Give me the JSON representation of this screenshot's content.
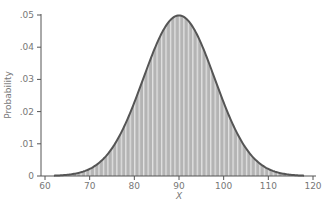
{
  "chart_data": {
    "type": "area",
    "title": "",
    "xlabel": "X",
    "ylabel": "Probability",
    "xlim": [
      60,
      120
    ],
    "ylim": [
      0,
      0.05
    ],
    "x_ticks": [
      60,
      70,
      80,
      90,
      100,
      110,
      120
    ],
    "x_tick_labels": [
      "60",
      "70",
      "80",
      "90",
      "100",
      "110",
      "120"
    ],
    "y_ticks": [
      0,
      0.01,
      0.02,
      0.03,
      0.04,
      0.05
    ],
    "y_tick_labels": [
      "0",
      ".01",
      ".02",
      ".03",
      ".04",
      ".05"
    ],
    "grid": false,
    "legend": null,
    "series": [
      {
        "name": "Normal distribution (mean 90, sd 8)",
        "distribution": "normal",
        "mean": 90,
        "sd": 8,
        "x": [
          62,
          66,
          70,
          74,
          78,
          82,
          86,
          90,
          94,
          98,
          102,
          106,
          110,
          114,
          118
        ],
        "values": [
          0.0011,
          0.0055,
          0.0228,
          0.0068,
          0.0161,
          0.0302,
          0.044,
          0.0499,
          0.044,
          0.0302,
          0.0161,
          0.0068,
          0.0022,
          0.0055,
          0.0011
        ],
        "fill": "#bdbdbd",
        "stroke": "#555555",
        "fill_pattern": "vertical-stripes"
      }
    ]
  }
}
